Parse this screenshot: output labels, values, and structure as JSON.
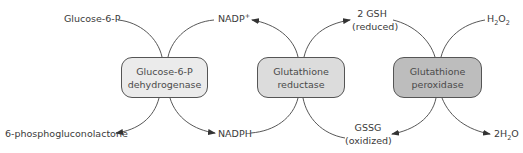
{
  "diagram": {
    "enzymes": [
      {
        "id": "g6pd",
        "line1": "Glucose-6-P",
        "line2": "dehydrogenase",
        "fill": "#ebebeb"
      },
      {
        "id": "gr",
        "line1": "Glutathione",
        "line2": "reductase",
        "fill": "#dcdcdc"
      },
      {
        "id": "gpx",
        "line1": "Glutathione",
        "line2": "peroxidase",
        "fill": "#bdbdbd"
      }
    ],
    "metabolites": {
      "glucose6p": "Glucose-6-P",
      "phosphogluconolactone": "6-phosphogluconolactone",
      "nadp_base": "NADP",
      "nadp_sup": "+",
      "nadph": "NADPH",
      "gsh_line1": "2 GSH",
      "gsh_line2": "(reduced)",
      "gssg_line1": "GSSG",
      "gssg_line2": "(oxidized)",
      "h2o2_h": "H",
      "h2o2_sub1": "2",
      "h2o2_o": "O",
      "h2o2_sub2": "2",
      "water_prefix": "2H",
      "water_sub": "2",
      "water_o": "O"
    },
    "colors": {
      "line": "#444444",
      "border": "#555555"
    }
  }
}
